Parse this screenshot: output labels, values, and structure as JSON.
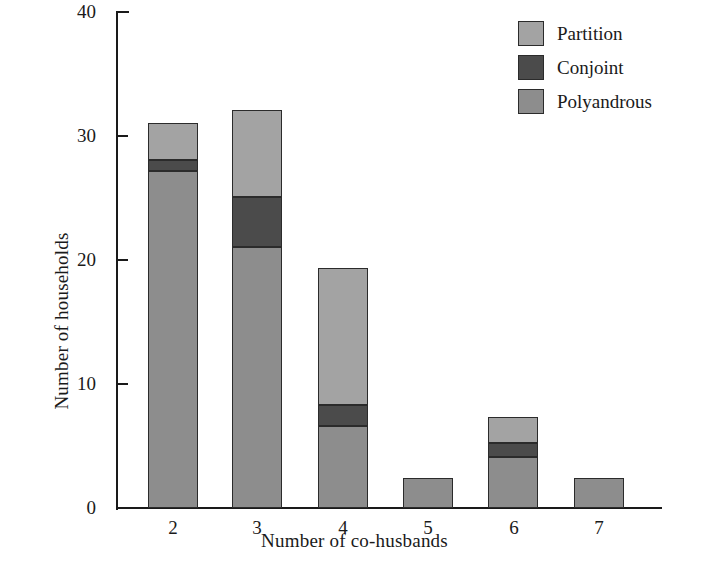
{
  "chart_data": {
    "type": "bar",
    "subtype": "stacked-bar",
    "title": "",
    "xlabel": "Number of co-husbands",
    "ylabel": "Number of households",
    "categories": [
      "2",
      "3",
      "4",
      "5",
      "6",
      "7"
    ],
    "xlim": [
      1.5,
      7.5
    ],
    "ylim": [
      0,
      40
    ],
    "yticks": [
      0,
      10,
      20,
      30,
      40
    ],
    "ytick_labels": [
      "0",
      "10",
      "20",
      "30",
      "40"
    ],
    "xtick_labels": [
      "2",
      "3",
      "4",
      "5",
      "6",
      "7"
    ],
    "grid": false,
    "legend_position": "top-right",
    "series": [
      {
        "name": "Polyandrous",
        "color": "#8d8d8d",
        "values": [
          27.1,
          21.0,
          6.6,
          2.4,
          4.1,
          2.4
        ]
      },
      {
        "name": "Conjoint",
        "color": "#4b4b4b",
        "values": [
          0.9,
          4.0,
          1.7,
          0.0,
          1.1,
          0.0
        ]
      },
      {
        "name": "Partition",
        "color": "#a3a3a3",
        "values": [
          3.0,
          7.0,
          11.0,
          0.0,
          2.1,
          0.0
        ]
      }
    ],
    "totals": [
      31.0,
      32.0,
      19.3,
      2.4,
      7.3,
      2.4
    ],
    "stack_order_bottom_to_top": [
      "Polyandrous",
      "Conjoint",
      "Partition"
    ]
  },
  "legend": {
    "items": [
      {
        "label": "Partition",
        "color": "#a3a3a3"
      },
      {
        "label": "Conjoint",
        "color": "#4b4b4b"
      },
      {
        "label": "Polyandrous",
        "color": "#8d8d8d"
      }
    ]
  },
  "axes": {
    "x_title": "Number of co-husbands",
    "y_title": "Number of households",
    "y_labels": [
      "40",
      "30",
      "20",
      "10",
      "0"
    ],
    "x_labels": [
      "2",
      "3",
      "4",
      "5",
      "6",
      "7"
    ]
  },
  "colors": {
    "partition": "#a3a3a3",
    "conjoint": "#4b4b4b",
    "polyandrous": "#8d8d8d",
    "axis": "#1a1a1a",
    "background": "#ffffff"
  }
}
